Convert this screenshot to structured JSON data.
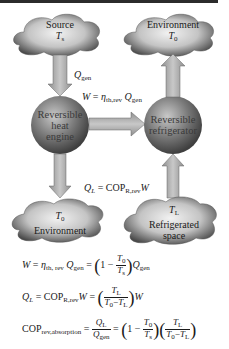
{
  "diagram": {
    "nodes": {
      "source": {
        "label": "Source",
        "temp": "T",
        "temp_sub": "s"
      },
      "environment_top": {
        "label": "Environment",
        "temp": "T",
        "temp_sub": "0"
      },
      "heat_engine": {
        "line1": "Reversible",
        "line2": "heat",
        "line3": "engine"
      },
      "refrigerator": {
        "line1": "Reversible",
        "line2": "refrigerator"
      },
      "environment_bottom": {
        "label": "Environment",
        "temp": "T",
        "temp_sub": "0"
      },
      "refrigerated_space": {
        "line1": "Refrigerated",
        "line2": "space",
        "temp": "T",
        "temp_sub": "L"
      }
    },
    "arrows": {
      "q_gen": {
        "symbol": "Q",
        "sub": "gen"
      },
      "work": {
        "lhs": "W",
        "eq": " = ",
        "eta": "η",
        "eta_sub": "th,rev",
        "q": "Q",
        "q_sub": "gen"
      },
      "q_l": {
        "lhs": "Q",
        "lhs_sub": "L",
        "eq": " = COP",
        "cop_sub": "R,rev",
        "w": "W"
      }
    },
    "colors": {
      "arrow_fill": "#b4b4b4",
      "sphere_dark": "#3f3f3f",
      "sphere_light": "#c8c8c8",
      "cloud_dark": "#4a4a4a",
      "cloud_light": "#e0e0e0",
      "top_bar": "#2b2b2b"
    }
  },
  "equations": {
    "eq1": {
      "W": "W",
      "eq": " = ",
      "eta": "η",
      "eta_sub": "th, rev",
      "Q": "Q",
      "Q_sub": "gen",
      "eq2": " = ",
      "one": "1 − ",
      "num": "T",
      "num_sub": "0",
      "den": "T",
      "den_sub": "s",
      "Q2": "Q",
      "Q2_sub": "gen"
    },
    "eq2": {
      "QL": "Q",
      "QL_sub": "L",
      "eq": " = COP",
      "cop_sub": "R,rev",
      "W": "W",
      "eq2": " = ",
      "num": "T",
      "num_sub": "L",
      "den_a": "T",
      "den_a_sub": "0",
      "den_minus": "−",
      "den_b": "T",
      "den_b_sub": "L",
      "W2": "W"
    },
    "eq3": {
      "cop": "COP",
      "cop_sub": "rev,absorption",
      "eq": " = ",
      "num": "Q",
      "num_sub": "L",
      "den": "Q",
      "den_sub": "gen",
      "eq2": " = ",
      "one": "1 − ",
      "f1_num": "T",
      "f1_num_sub": "0",
      "f1_den": "T",
      "f1_den_sub": "s",
      "f2_num": "T",
      "f2_num_sub": "L",
      "f2_den_a": "T",
      "f2_den_a_sub": "0",
      "f2_den_minus": "−",
      "f2_den_b": "T",
      "f2_den_b_sub": "L"
    }
  }
}
